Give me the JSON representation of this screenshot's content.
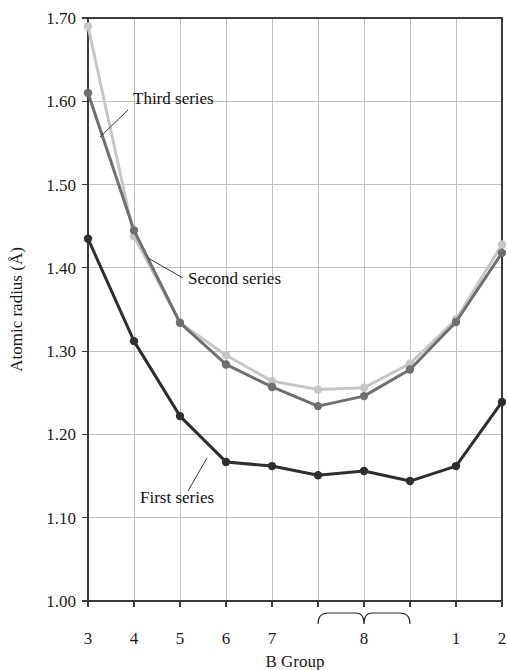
{
  "chart_data": {
    "type": "line",
    "title": "",
    "xlabel": "B Group",
    "ylabel": "Atomic radius (Å)",
    "x": [
      1,
      2,
      3,
      4,
      5,
      6,
      7,
      8,
      9,
      10
    ],
    "categories": [
      "3",
      "4",
      "5",
      "6",
      "7",
      "8",
      "8",
      "8",
      "1",
      "2"
    ],
    "xtick_labels": [
      "3",
      "4",
      "5",
      "6",
      "7",
      "8",
      "1",
      "2"
    ],
    "ytick_labels": [
      "1.00",
      "1.10",
      "1.20",
      "1.30",
      "1.40",
      "1.50",
      "1.60",
      "1.70"
    ],
    "ylim": [
      1.0,
      1.7
    ],
    "ytick_values": [
      1.0,
      1.1,
      1.2,
      1.3,
      1.4,
      1.5,
      1.6,
      1.7
    ],
    "grid": true,
    "legend_position": "inline-annotations",
    "group8_brace_label": "8",
    "series": [
      {
        "name": "First series",
        "color": "#2e2e2e",
        "values": [
          1.435,
          1.312,
          1.222,
          1.167,
          1.162,
          1.151,
          1.156,
          1.144,
          1.162,
          1.239
        ]
      },
      {
        "name": "Second series",
        "color": "#6f6f6f",
        "values": [
          1.61,
          1.445,
          1.334,
          1.284,
          1.257,
          1.234,
          1.246,
          1.278,
          1.335,
          1.418
        ]
      },
      {
        "name": "Third series",
        "color": "#c6c6c6",
        "values": [
          1.69,
          1.438,
          1.334,
          1.295,
          1.264,
          1.254,
          1.256,
          1.285,
          1.338,
          1.428
        ]
      }
    ],
    "annotations": [
      {
        "text": "Third series",
        "for_series": "Third series"
      },
      {
        "text": "Second series",
        "for_series": "Second series"
      },
      {
        "text": "First series",
        "for_series": "First series"
      }
    ]
  }
}
